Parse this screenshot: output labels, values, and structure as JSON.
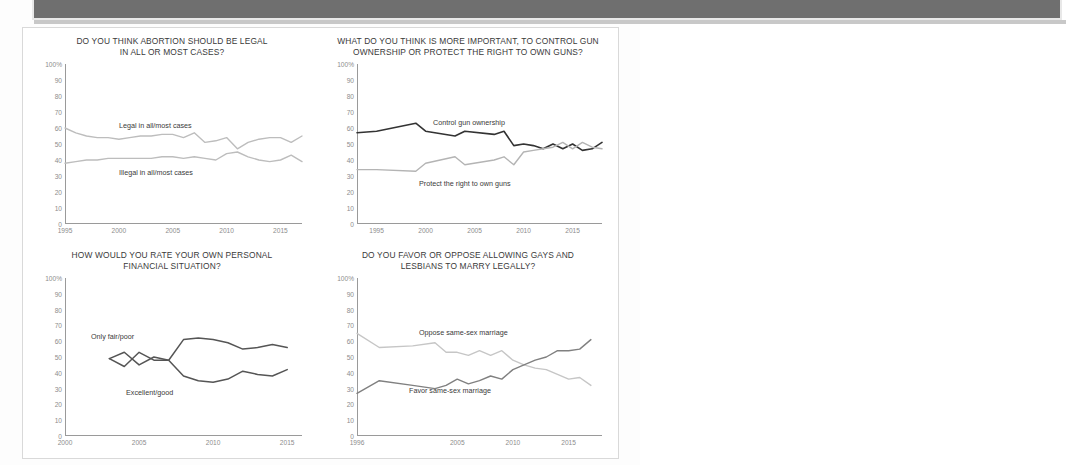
{
  "banner": {
    "text": ""
  },
  "charts": [
    {
      "id": "abortion",
      "title_line1": "DO YOU THINK ABORTION SHOULD BE LEGAL",
      "title_line2": "IN ALL OR MOST CASES?",
      "yticks": [
        "100%",
        "90",
        "80",
        "70",
        "60",
        "50",
        "40",
        "30",
        "20",
        "10",
        "0"
      ],
      "xticks": [
        "1995",
        "2000",
        "2005",
        "2010",
        "2015"
      ],
      "series": [
        {
          "name": "Legal in all/most cases",
          "color": "#bdbdbd"
        },
        {
          "name": "Illegal in all/most cases",
          "color": "#bdbdbd"
        }
      ]
    },
    {
      "id": "guns",
      "title_line1": "WHAT DO YOU THINK IS MORE IMPORTANT, TO CONTROL GUN",
      "title_line2": "OWNERSHIP OR PROTECT THE RIGHT TO OWN GUNS?",
      "yticks": [
        "100%",
        "90",
        "80",
        "70",
        "60",
        "50",
        "40",
        "30",
        "20",
        "10",
        "0"
      ],
      "xticks": [
        "1995",
        "2000",
        "2005",
        "2010",
        "2015"
      ],
      "series": [
        {
          "name": "Control gun ownership",
          "color": "#333333"
        },
        {
          "name": "Protect the right to own guns",
          "color": "#b4b4b4"
        }
      ]
    },
    {
      "id": "finances",
      "title_line1": "HOW WOULD YOU RATE YOUR OWN PERSONAL",
      "title_line2": "FINANCIAL SITUATION?",
      "yticks": [
        "100%",
        "90",
        "80",
        "70",
        "60",
        "50",
        "40",
        "30",
        "20",
        "10",
        "0"
      ],
      "xticks": [
        "2000",
        "2005",
        "2010",
        "2015"
      ],
      "series": [
        {
          "name": "Only fair/poor",
          "color": "#555555"
        },
        {
          "name": "Excellent/good",
          "color": "#555555"
        }
      ]
    },
    {
      "id": "marriage",
      "title_line1": "DO YOU FAVOR OR OPPOSE ALLOWING GAYS AND",
      "title_line2": "LESBIANS TO MARRY LEGALLY?",
      "yticks": [
        "100%",
        "90",
        "80",
        "70",
        "60",
        "50",
        "40",
        "30",
        "20",
        "10",
        "0"
      ],
      "xticks": [
        "1996",
        "2005",
        "2010",
        "2015"
      ],
      "series": [
        {
          "name": "Oppose same-sex marriage",
          "color": "#c6c6c6"
        },
        {
          "name": "Favor same-sex marriage",
          "color": "#808080"
        }
      ]
    }
  ],
  "chart_data": [
    {
      "type": "line",
      "title": "DO YOU THINK ABORTION SHOULD BE LEGAL IN ALL OR MOST CASES?",
      "xlabel": "",
      "ylabel": "",
      "ylim": [
        0,
        100
      ],
      "xlim": [
        1995,
        2017
      ],
      "grid": false,
      "legend": "inline-labels",
      "x": [
        1995,
        1996,
        1997,
        1998,
        1999,
        2000,
        2001,
        2002,
        2003,
        2004,
        2005,
        2006,
        2007,
        2008,
        2009,
        2010,
        2011,
        2012,
        2013,
        2014,
        2015,
        2016,
        2017
      ],
      "series": [
        {
          "name": "Legal in all/most cases",
          "values": [
            60,
            57,
            55,
            54,
            54,
            53,
            54,
            55,
            55,
            56,
            56,
            54,
            57,
            51,
            52,
            54,
            47,
            51,
            53,
            54,
            54,
            51,
            55
          ]
        },
        {
          "name": "Illegal in all/most cases",
          "values": [
            38,
            39,
            40,
            40,
            41,
            41,
            41,
            41,
            41,
            42,
            42,
            41,
            42,
            41,
            40,
            44,
            45,
            42,
            40,
            39,
            40,
            43,
            39
          ]
        }
      ]
    },
    {
      "type": "line",
      "title": "WHAT DO YOU THINK IS MORE IMPORTANT, TO CONTROL GUN OWNERSHIP OR PROTECT THE RIGHT TO OWN GUNS?",
      "xlabel": "",
      "ylabel": "",
      "ylim": [
        0,
        100
      ],
      "xlim": [
        1993,
        2018
      ],
      "grid": false,
      "legend": "inline-labels",
      "x": [
        1993,
        1995,
        1999,
        2000,
        2003,
        2004,
        2007,
        2008,
        2009,
        2010,
        2011,
        2012,
        2013,
        2014,
        2015,
        2016,
        2017,
        2018
      ],
      "series": [
        {
          "name": "Control gun ownership",
          "values": [
            57,
            58,
            63,
            58,
            55,
            58,
            56,
            58,
            49,
            50,
            49,
            47,
            50,
            47,
            50,
            46,
            47,
            51
          ]
        },
        {
          "name": "Protect the right to own guns",
          "values": [
            34,
            34,
            33,
            38,
            42,
            37,
            40,
            42,
            37,
            45,
            46,
            47,
            48,
            51,
            47,
            51,
            48,
            47
          ]
        }
      ]
    },
    {
      "type": "line",
      "title": "HOW WOULD YOU RATE YOUR OWN PERSONAL FINANCIAL SITUATION?",
      "xlabel": "",
      "ylabel": "",
      "ylim": [
        0,
        100
      ],
      "xlim": [
        2000,
        2016
      ],
      "grid": false,
      "legend": "inline-labels",
      "x": [
        2003,
        2004,
        2005,
        2006,
        2007,
        2008,
        2009,
        2010,
        2011,
        2012,
        2013,
        2014,
        2015
      ],
      "series": [
        {
          "name": "Only fair/poor",
          "values": [
            49,
            44,
            53,
            48,
            48,
            61,
            62,
            61,
            59,
            55,
            56,
            58,
            56
          ]
        },
        {
          "name": "Excellent/good",
          "values": [
            49,
            53,
            45,
            50,
            48,
            38,
            35,
            34,
            36,
            41,
            39,
            38,
            42
          ]
        }
      ]
    },
    {
      "type": "line",
      "title": "DO YOU FAVOR OR OPPOSE ALLOWING GAYS AND LESBIANS TO MARRY LEGALLY?",
      "xlabel": "",
      "ylabel": "",
      "ylim": [
        0,
        100
      ],
      "xlim": [
        1996,
        2018
      ],
      "grid": false,
      "legend": "inline-labels",
      "x": [
        1996,
        1998,
        2001,
        2003,
        2004,
        2005,
        2006,
        2007,
        2008,
        2009,
        2010,
        2011,
        2012,
        2013,
        2014,
        2015,
        2016,
        2017
      ],
      "series": [
        {
          "name": "Oppose same-sex marriage",
          "values": [
            65,
            56,
            57,
            59,
            53,
            53,
            51,
            54,
            51,
            54,
            48,
            45,
            43,
            42,
            39,
            36,
            37,
            32
          ]
        },
        {
          "name": "Favor same-sex marriage",
          "values": [
            27,
            35,
            32,
            30,
            32,
            36,
            33,
            35,
            38,
            36,
            42,
            45,
            48,
            50,
            54,
            54,
            55,
            61
          ]
        }
      ]
    }
  ]
}
